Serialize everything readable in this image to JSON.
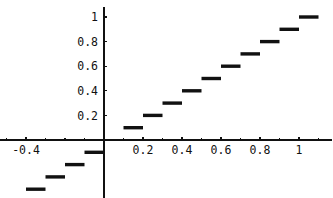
{
  "chart": {
    "title": "",
    "subtitle": "",
    "type_label": "step-plot"
  },
  "chart_data": {
    "type": "scatter",
    "title": "",
    "subtitle": "",
    "xlabel": "",
    "ylabel": "",
    "xlim": [
      -0.55,
      1.17
    ],
    "ylim": [
      -0.55,
      1.08
    ],
    "grid": false,
    "legend": null,
    "x_ticks": [
      {
        "value": -0.4,
        "label": "-0.4"
      },
      {
        "value": 0.2,
        "label": "0.2"
      },
      {
        "value": 0.4,
        "label": "0.4"
      },
      {
        "value": 0.6,
        "label": "0.6"
      },
      {
        "value": 0.8,
        "label": "0.8"
      },
      {
        "value": 1,
        "label": "1"
      }
    ],
    "y_ticks": [
      {
        "value": 0.2,
        "label": "0.2"
      },
      {
        "value": 0.4,
        "label": "0.4"
      },
      {
        "value": 0.6,
        "label": "0.6"
      },
      {
        "value": 0.8,
        "label": "0.8"
      },
      {
        "value": 1,
        "label": "1"
      }
    ],
    "x_tick_minor": [
      -0.5,
      -0.3,
      -0.2,
      -0.1,
      0.1,
      0.3,
      0.5,
      0.7,
      0.9,
      1.1
    ],
    "series": [
      {
        "name": "step",
        "color": "#111111",
        "segments": [
          {
            "x0": -0.5,
            "x1": -0.4,
            "y": -0.5
          },
          {
            "x0": -0.4,
            "x1": -0.3,
            "y": -0.4
          },
          {
            "x0": -0.3,
            "x1": -0.2,
            "y": -0.3
          },
          {
            "x0": -0.2,
            "x1": -0.1,
            "y": -0.2
          },
          {
            "x0": -0.1,
            "x1": 0.0,
            "y": -0.1
          },
          {
            "x0": 0.1,
            "x1": 0.2,
            "y": 0.1
          },
          {
            "x0": 0.2,
            "x1": 0.3,
            "y": 0.2
          },
          {
            "x0": 0.3,
            "x1": 0.4,
            "y": 0.3
          },
          {
            "x0": 0.4,
            "x1": 0.5,
            "y": 0.4
          },
          {
            "x0": 0.5,
            "x1": 0.6,
            "y": 0.5
          },
          {
            "x0": 0.6,
            "x1": 0.7,
            "y": 0.6
          },
          {
            "x0": 0.7,
            "x1": 0.8,
            "y": 0.7
          },
          {
            "x0": 0.8,
            "x1": 0.9,
            "y": 0.8
          },
          {
            "x0": 0.9,
            "x1": 1.0,
            "y": 0.9
          },
          {
            "x0": 1.0,
            "x1": 1.1,
            "y": 1.0
          }
        ]
      }
    ]
  },
  "axes": {
    "x_axis_name": "x-axis",
    "y_axis_name": "y-axis",
    "axis_color": "#111111"
  }
}
